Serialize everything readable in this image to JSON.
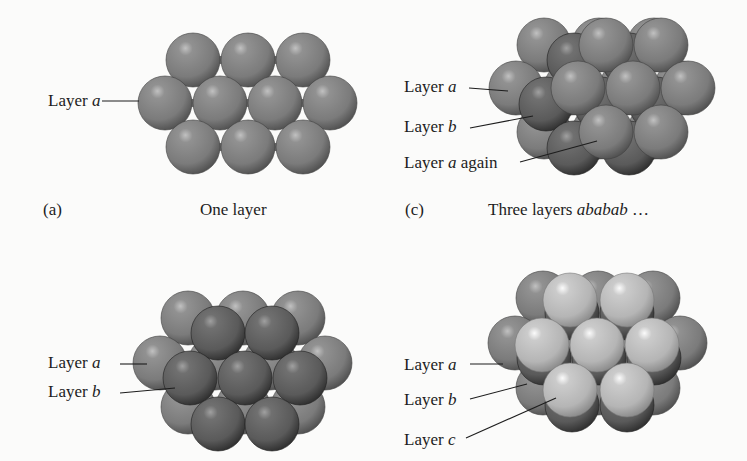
{
  "figure": {
    "colors": {
      "background": "#fbfbfa",
      "layer_a": "#7b7b7b",
      "layer_b": "#5a5a5a",
      "layer_c": "#b5b5b5",
      "text": "#1d1d1d",
      "interstitial": "#6a6a6a"
    },
    "sphere_radius": 27,
    "panels": [
      {
        "id": "a",
        "tag": "(a)",
        "caption": "One layer",
        "caption_italic": "",
        "tag_pos": [
          43,
          215
        ],
        "caption_pos": [
          200,
          215
        ],
        "labels": [
          {
            "prefix": "Layer ",
            "italic": "a",
            "suffix": "",
            "pos": [
              48,
              106
            ],
            "leader": [
              [
                102,
                101
              ],
              [
                139,
                101
              ]
            ]
          }
        ],
        "layers": [
          {
            "name": "a",
            "shade": "layer_a",
            "spheres": [
              [
                193,
                60
              ],
              [
                248,
                60
              ],
              [
                303,
                60
              ],
              [
                165,
                103
              ],
              [
                220,
                103
              ],
              [
                275,
                103
              ],
              [
                330,
                103
              ],
              [
                193,
                147
              ],
              [
                248,
                147
              ],
              [
                303,
                147
              ]
            ]
          }
        ]
      },
      {
        "id": "c",
        "tag": "(c)",
        "caption": "Three layers ",
        "caption_italic": "ababab",
        "caption_suffix": " …",
        "tag_pos": [
          405,
          215
        ],
        "caption_pos": [
          488,
          215
        ],
        "labels": [
          {
            "prefix": "Layer ",
            "italic": "a",
            "suffix": "",
            "pos": [
              404,
              92
            ],
            "leader": [
              [
                469,
                88
              ],
              [
                508,
                91
              ]
            ]
          },
          {
            "prefix": "Layer ",
            "italic": "b",
            "suffix": "",
            "pos": [
              404,
              132
            ],
            "leader": [
              [
                470,
                128
              ],
              [
                533,
                116
              ]
            ]
          },
          {
            "prefix": "Layer ",
            "italic": "a",
            "suffix": " again",
            "pos": [
              404,
              168
            ],
            "leader": [
              [
                520,
                162
              ],
              [
                597,
                141
              ]
            ]
          }
        ],
        "layers": [
          {
            "name": "a",
            "shade": "layer_a",
            "spheres": [
              [
                544,
                45
              ],
              [
                599,
                45
              ],
              [
                654,
                45
              ],
              [
                516,
                88
              ],
              [
                571,
                88
              ],
              [
                626,
                88
              ],
              [
                681,
                88
              ],
              [
                544,
                132
              ],
              [
                599,
                132
              ],
              [
                654,
                132
              ]
            ]
          },
          {
            "name": "b",
            "shade": "layer_b",
            "spheres": [
              [
                574,
                60
              ],
              [
                629,
                60
              ],
              [
                546,
                104
              ],
              [
                601,
                104
              ],
              [
                656,
                104
              ],
              [
                574,
                148
              ],
              [
                629,
                148
              ]
            ]
          },
          {
            "name": "a_again",
            "shade": "layer_a",
            "spheres": [
              [
                606,
                45
              ],
              [
                661,
                45
              ],
              [
                578,
                88
              ],
              [
                633,
                88
              ],
              [
                688,
                88
              ],
              [
                606,
                132
              ],
              [
                661,
                132
              ]
            ]
          }
        ]
      },
      {
        "id": "b",
        "tag": "",
        "caption": "",
        "labels": [
          {
            "prefix": "Layer ",
            "italic": "a",
            "suffix": "",
            "pos": [
              48,
              368
            ],
            "leader": [
              [
                120,
                364
              ],
              [
                147,
                364
              ]
            ]
          },
          {
            "prefix": "Layer ",
            "italic": "b",
            "suffix": "",
            "pos": [
              48,
              397
            ],
            "leader": [
              [
                120,
                393
              ],
              [
                175,
                388
              ]
            ]
          }
        ],
        "layers": [
          {
            "name": "a",
            "shade": "layer_a",
            "spheres": [
              [
                188,
                318
              ],
              [
                243,
                318
              ],
              [
                298,
                318
              ],
              [
                160,
                363
              ],
              [
                215,
                363
              ],
              [
                270,
                363
              ],
              [
                325,
                363
              ],
              [
                188,
                407
              ],
              [
                243,
                407
              ],
              [
                298,
                407
              ]
            ]
          },
          {
            "name": "b",
            "shade": "layer_b",
            "spheres": [
              [
                218,
                333
              ],
              [
                272,
                333
              ],
              [
                190,
                378
              ],
              [
                245,
                378
              ],
              [
                300,
                378
              ],
              [
                218,
                424
              ],
              [
                272,
                424
              ]
            ]
          }
        ]
      },
      {
        "id": "d",
        "tag": "",
        "caption": "",
        "labels": [
          {
            "prefix": "Layer ",
            "italic": "a",
            "suffix": "",
            "pos": [
              404,
              370
            ],
            "leader": [
              [
                470,
                364
              ],
              [
                503,
                364
              ]
            ]
          },
          {
            "prefix": "Layer ",
            "italic": "b",
            "suffix": "",
            "pos": [
              404,
              405
            ],
            "leader": [
              [
                470,
                399
              ],
              [
                527,
                384
              ]
            ]
          },
          {
            "prefix": "Layer ",
            "italic": "c",
            "suffix": "",
            "pos": [
              404,
              445
            ],
            "leader": [
              [
                466,
                438
              ],
              [
                556,
                398
              ]
            ]
          }
        ],
        "layers": [
          {
            "name": "a",
            "shade": "layer_a",
            "spheres": [
              [
                543,
                298
              ],
              [
                598,
                298
              ],
              [
                653,
                298
              ],
              [
                515,
                343
              ],
              [
                570,
                343
              ],
              [
                625,
                343
              ],
              [
                680,
                343
              ],
              [
                543,
                388
              ],
              [
                598,
                388
              ],
              [
                653,
                388
              ]
            ]
          },
          {
            "name": "b",
            "shade": "layer_b",
            "spheres": [
              [
                572,
                313
              ],
              [
                627,
                313
              ],
              [
                544,
                358
              ],
              [
                599,
                358
              ],
              [
                654,
                358
              ],
              [
                572,
                405
              ],
              [
                627,
                405
              ]
            ]
          },
          {
            "name": "c",
            "shade": "layer_c",
            "spheres": [
              [
                570,
                300
              ],
              [
                627,
                300
              ],
              [
                542,
                345
              ],
              [
                597,
                345
              ],
              [
                652,
                345
              ],
              [
                570,
                390
              ],
              [
                627,
                390
              ]
            ]
          }
        ]
      }
    ]
  }
}
